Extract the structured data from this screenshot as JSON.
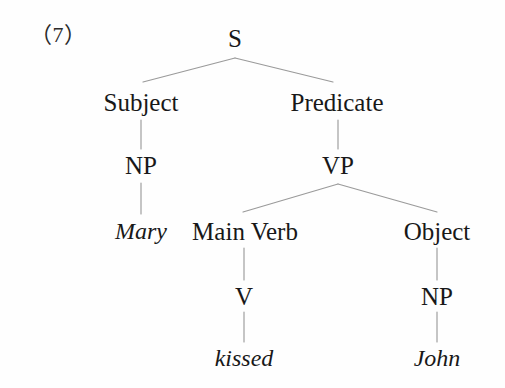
{
  "figure": {
    "example_number": "（7）",
    "background_color": "#fefefe",
    "line_color": "#9a9a9a",
    "text_color": "#181818",
    "width": 505,
    "height": 388
  },
  "tree": {
    "root": {
      "label": "S"
    },
    "nodes": {
      "s": "S",
      "subject": "Subject",
      "predicate": "Predicate",
      "subject_np": "NP",
      "vp": "VP",
      "mary": "Mary",
      "main_verb": "Main Verb",
      "object": "Object",
      "v": "V",
      "object_np": "NP",
      "kissed": "kissed",
      "john": "John"
    }
  }
}
